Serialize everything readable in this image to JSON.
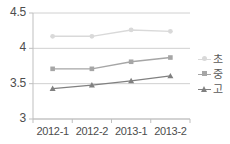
{
  "chart_data": {
    "type": "line",
    "title": "",
    "xlabel": "",
    "ylabel": "",
    "categories": [
      "2012-1",
      "2012-2",
      "2013-1",
      "2013-2"
    ],
    "ylim": [
      3,
      4.5
    ],
    "ytick_labels": [
      "4.5",
      "4",
      "3.5",
      "3"
    ],
    "ytick_values": [
      4.5,
      4,
      3.5,
      3
    ],
    "grid": true,
    "legend_position": "right",
    "series": [
      {
        "name": "초",
        "values": [
          4.17,
          4.17,
          4.26,
          4.24
        ],
        "color": "#d9d9d9",
        "marker": "circle"
      },
      {
        "name": "중",
        "values": [
          3.71,
          3.71,
          3.81,
          3.87
        ],
        "color": "#a6a6a6",
        "marker": "square"
      },
      {
        "name": "고",
        "values": [
          3.43,
          3.48,
          3.54,
          3.61
        ],
        "color": "#808080",
        "marker": "triangle"
      }
    ]
  },
  "axis": {
    "line_color": "#bfbfbf",
    "grid_color": "#d0d0d0",
    "tick_text_color": "#4d4d4d"
  }
}
